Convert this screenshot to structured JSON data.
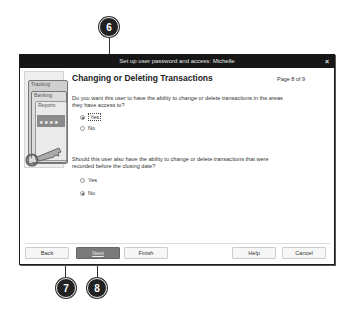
{
  "dialog": {
    "title": "Set up user password and access: Michelle",
    "close_label": "×",
    "heading": "Changing or Deleting Transactions",
    "page_indicator": "Page 8 of 9",
    "side_art": {
      "tabs": [
        "Tracking",
        "Banking",
        "Reports"
      ],
      "stars": "★★★★"
    },
    "question1": {
      "text": "Do you want this user to have the ability to change or delete transactions in the areas they have access to?",
      "options": [
        {
          "label": "Yes",
          "selected": true
        },
        {
          "label": "No",
          "selected": false
        }
      ]
    },
    "question2": {
      "text": "Should this user also have the ability to change or delete transactions that were recorded before the closing date?",
      "options": [
        {
          "label": "Yes",
          "selected": false
        },
        {
          "label": "No",
          "selected": true
        }
      ]
    },
    "buttons": {
      "back": "Back",
      "next": "Next",
      "finish": "Finish",
      "help": "Help",
      "cancel": "Cancel"
    }
  },
  "callouts": {
    "c6": "6",
    "c7": "7",
    "c8": "8"
  }
}
